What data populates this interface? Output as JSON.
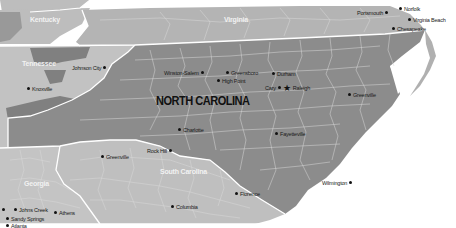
{
  "map": {
    "title": "NORTH CAROLINA",
    "colors": {
      "north_carolina": "#8c8c8c",
      "neighbor_dark": "#7d7d7d",
      "neighbor_light": "#bdbdbd",
      "virginia": "#b4b4b4",
      "south_carolina": "#bfbfbf",
      "georgia": "#c4c4c4",
      "state_border": "#ffffff",
      "water": "#ffffff"
    },
    "states": [
      {
        "name": "Kentucky"
      },
      {
        "name": "Virginia"
      },
      {
        "name": "Tennessee"
      },
      {
        "name": "South Carolina"
      },
      {
        "name": "Georgia"
      }
    ],
    "cities": [
      {
        "name": "Portsmouth"
      },
      {
        "name": "Norfolk"
      },
      {
        "name": "Virginia Beach"
      },
      {
        "name": "Chesapeake"
      },
      {
        "name": "Johnson City"
      },
      {
        "name": "Knoxville"
      },
      {
        "name": "Winston-Salem"
      },
      {
        "name": "Greensboro"
      },
      {
        "name": "High Point"
      },
      {
        "name": "Durham"
      },
      {
        "name": "Cary"
      },
      {
        "name": "Raleigh",
        "capital": true,
        "icon": "star-icon"
      },
      {
        "name": "Greenville"
      },
      {
        "name": "Charlotte"
      },
      {
        "name": "Fayetteville"
      },
      {
        "name": "Rock Hill"
      },
      {
        "name": "Greenville"
      },
      {
        "name": "Florence"
      },
      {
        "name": "Columbia"
      },
      {
        "name": "Wilmington"
      },
      {
        "name": "Johns Creek"
      },
      {
        "name": "Athens"
      },
      {
        "name": "Sandy Springs"
      },
      {
        "name": "Atlanta"
      }
    ]
  }
}
